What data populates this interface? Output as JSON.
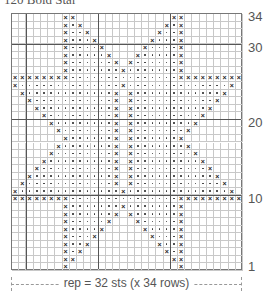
{
  "title": "120 Bold Star",
  "chart": {
    "columns": 32,
    "rows": 34,
    "row_labels": [
      {
        "row": 34,
        "text": "34"
      },
      {
        "row": 30,
        "text": "30"
      },
      {
        "row": 20,
        "text": "20"
      },
      {
        "row": 10,
        "text": "10"
      },
      {
        "row": 1,
        "text": "1"
      }
    ],
    "thick_col_boundaries": [
      2,
      12,
      22
    ],
    "thick_row_boundaries": [
      10,
      20,
      30
    ],
    "legend_symbols": {
      "x": "contrast-stitch",
      ".": "dot-stitch",
      " ": "blank"
    },
    "grid_rows_top_to_bottom": [
      "       xx             xx        ",
      "       x.x           x.x        ",
      "       x..x         x..x        ",
      "       x...x       x...x        ",
      "       x....x     x....x        ",
      "       x.....x   x.....x        ",
      "       x......x x......x        ",
      "       x.......x.......x        ",
      "xxxxxxxx...............xxxxxxxxx",
      "x..............x..............x ",
      " x............x x............x  ",
      "  x...........x x...........x   ",
      "   x..........x x..........x    ",
      "    x.........x x.........x     ",
      "     x........x x........x      ",
      "      x.......x x.......x       ",
      "       x......x x......x        ",
      "      x.......x x.......x       ",
      "     x........x x........x      ",
      "    x.........x x.........x     ",
      "   x..........x x..........x    ",
      "  x...........x x...........x   ",
      " x............x x............x  ",
      "x..............x..............x ",
      "xxxxxxxx...............xxxxxxxxx",
      "       x.......x.......x        ",
      "       x......x x......x        ",
      "       x.....x   x.....x        ",
      "       x....x     x....x        ",
      "       x...x       x...x        ",
      "       x..x         x..x        ",
      "       x.x           x.x        ",
      "       xx             xx        ",
      "       x               x        "
    ]
  },
  "footer": {
    "repeat_label": "rep = 32 sts (x 34 rows)"
  }
}
